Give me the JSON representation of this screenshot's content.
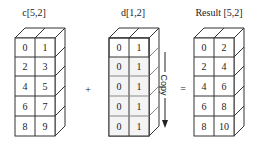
{
  "diagram": {
    "arrays": [
      {
        "id": "c",
        "title": "c[5,2]",
        "cells": [
          [
            "0",
            "1"
          ],
          [
            "2",
            "3"
          ],
          [
            "4",
            "5"
          ],
          [
            "6",
            "7"
          ],
          [
            "8",
            "9"
          ]
        ]
      },
      {
        "id": "d",
        "title": "d[1,2]",
        "cells": [
          [
            "0",
            "1"
          ],
          [
            "0",
            "1"
          ],
          [
            "0",
            "1"
          ],
          [
            "0",
            "1"
          ],
          [
            "0",
            "1"
          ]
        ]
      },
      {
        "id": "result",
        "title": "Result [5,2]",
        "cells": [
          [
            "0",
            "2"
          ],
          [
            "2",
            "4"
          ],
          [
            "4",
            "6"
          ],
          [
            "6",
            "8"
          ],
          [
            "8",
            "10"
          ]
        ]
      }
    ],
    "operators": {
      "plus": "+",
      "equals": "="
    },
    "copy_label": "Copy",
    "colors": {
      "line": "#333333",
      "shaded_rows": "#f2f2f2"
    }
  }
}
